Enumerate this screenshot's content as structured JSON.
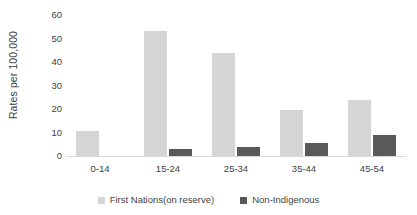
{
  "chart_data": {
    "type": "bar",
    "title": "",
    "subtitle": "",
    "xlabel": "",
    "ylabel": "Rates per 100,000",
    "ylim": [
      0,
      60
    ],
    "yticks": [
      0,
      10,
      20,
      30,
      40,
      50,
      60
    ],
    "grid": false,
    "legend_position": "bottom",
    "categories": [
      "0-14",
      "15-24",
      "25-34",
      "35-44",
      "45-54"
    ],
    "series": [
      {
        "name": "First Nations(on reserve)",
        "color": "#d5d5d5",
        "values": [
          10.5,
          53,
          44,
          19.5,
          24
        ]
      },
      {
        "name": "Non-Indigenous",
        "color": "#595959",
        "values": [
          0,
          3,
          4,
          5.5,
          9
        ]
      }
    ]
  },
  "axis": {
    "y_title": "Rates per 100,000",
    "y_tick_labels": [
      "60",
      "50",
      "40",
      "30",
      "20",
      "10",
      "0"
    ],
    "x_tick_labels": [
      "0-14",
      "15-24",
      "25-34",
      "35-44",
      "45-54"
    ]
  },
  "legend": {
    "items": [
      {
        "label": "First Nations(on reserve)",
        "color": "#d5d5d5"
      },
      {
        "label": "Non-Indigenous",
        "color": "#595959"
      }
    ]
  },
  "colors": {
    "series_a": "#d5d5d5",
    "series_b": "#595959",
    "axis_line": "#d9d9d9",
    "text": "#404040",
    "background": "#ffffff"
  }
}
